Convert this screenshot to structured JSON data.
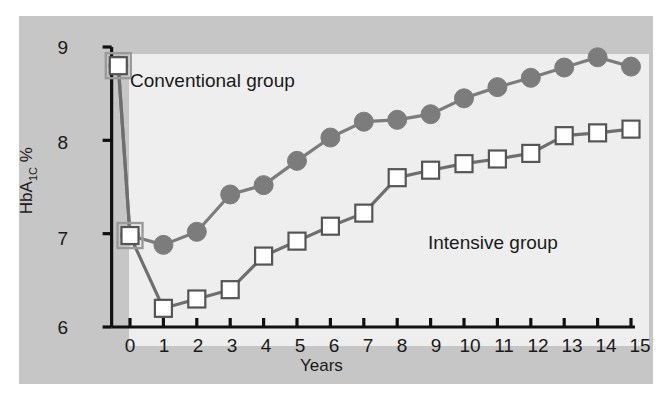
{
  "chart_data": {
    "type": "line",
    "title": "",
    "subtitle": "",
    "xlabel": "Years",
    "ylabel": "HbA1C %",
    "ylabel_html": "HbA<sub>1C</sub> %",
    "xlim": [
      -0.5,
      15
    ],
    "ylim": [
      6,
      9
    ],
    "xticks": [
      0,
      1,
      2,
      3,
      4,
      5,
      6,
      7,
      8,
      9,
      10,
      11,
      12,
      13,
      14,
      15
    ],
    "xticklabels": [
      "0",
      "1",
      "2",
      "3",
      "4",
      "5",
      "6",
      "7",
      "8",
      "9",
      "10",
      "11",
      "12",
      "13",
      "14",
      "15"
    ],
    "yticks": [
      6,
      7,
      8,
      9
    ],
    "yticklabels": [
      "6",
      "7",
      "8",
      "9"
    ],
    "grid": false,
    "legend_position": "inline-annotations",
    "baseline_x": -0.35,
    "baseline_y": 8.8,
    "series": [
      {
        "name": "Conventional group",
        "marker": "filled-circle",
        "color": "#7c7c7c",
        "line_color": "#7c7c7c",
        "x": [
          -0.35,
          0,
          1,
          2,
          3,
          4,
          5,
          6,
          7,
          8,
          9,
          10,
          11,
          12,
          13,
          14,
          15
        ],
        "values": [
          8.8,
          6.98,
          6.88,
          7.02,
          7.42,
          7.52,
          7.78,
          8.03,
          8.2,
          8.22,
          8.28,
          8.45,
          8.57,
          8.67,
          8.78,
          8.89,
          8.79
        ]
      },
      {
        "name": "Intensive group",
        "marker": "open-square",
        "color": "#ffffff",
        "line_color": "#6e6e6e",
        "edge_color": "#555555",
        "x": [
          -0.35,
          0,
          1,
          2,
          3,
          4,
          5,
          6,
          7,
          8,
          9,
          10,
          11,
          12,
          13,
          14,
          15
        ],
        "values": [
          8.8,
          6.98,
          6.2,
          6.3,
          6.4,
          6.76,
          6.92,
          7.08,
          7.22,
          7.6,
          7.68,
          7.75,
          7.8,
          7.86,
          8.05,
          8.08,
          8.12
        ]
      }
    ],
    "annotations": [
      {
        "text": "Conventional group",
        "x": 1.2,
        "y": 8.6
      },
      {
        "text": "Intensive group",
        "x": 10.2,
        "y": 6.75
      }
    ],
    "colors": {
      "figure_background": "#ffffff",
      "panel_background": "#c6c6c6",
      "plot_background": "#eeeeee",
      "axis": "#111111",
      "conventional_marker": "#7c7c7c",
      "intensive_marker_fill": "#ffffff",
      "intensive_marker_edge": "#555555",
      "text": "#1a1a1a"
    }
  },
  "axis": {
    "y_label": "HbA",
    "y_label_sub": "1C",
    "y_label_pct": " %",
    "x_label": "Years"
  },
  "labels": {
    "conventional": "Conventional group",
    "intensive": "Intensive group"
  },
  "yticks": {
    "t0": "6",
    "t1": "7",
    "t2": "8",
    "t3": "9"
  },
  "xticks": {
    "t0": "0",
    "t1": "1",
    "t2": "2",
    "t3": "3",
    "t4": "4",
    "t5": "5",
    "t6": "6",
    "t7": "7",
    "t8": "8",
    "t9": "9",
    "t10": "10",
    "t11": "11",
    "t12": "12",
    "t13": "13",
    "t14": "14",
    "t15": "15"
  }
}
